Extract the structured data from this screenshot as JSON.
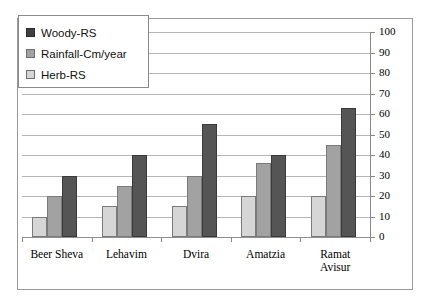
{
  "chart_data": {
    "type": "bar",
    "title": "",
    "subtitle": "",
    "xlabel": "",
    "ylabel": "",
    "ylim": [
      0,
      100
    ],
    "ytick_step": 10,
    "yticks": [
      100,
      90,
      80,
      70,
      60,
      50,
      40,
      30,
      20,
      10,
      0
    ],
    "grid": true,
    "value_axis_position": "right",
    "legend_position": "top-left",
    "categories": [
      "Beer Sheva",
      "Lehavim",
      "Dvira",
      "Amatzia",
      "Ramat\nAvisur"
    ],
    "series": [
      {
        "name": "Herb-RS",
        "color": "#d6d6d6",
        "values": [
          10,
          15,
          15,
          20,
          20
        ]
      },
      {
        "name": "Rainfall-Cm/year",
        "color": "#a2a2a2",
        "values": [
          20,
          25,
          30,
          36,
          45
        ]
      },
      {
        "name": "Woody-RS",
        "color": "#555555",
        "values": [
          30,
          40,
          55,
          40,
          63
        ]
      }
    ],
    "legend_order": [
      "Woody-RS",
      "Rainfall-Cm/year",
      "Herb-RS"
    ]
  },
  "legend": {
    "items": [
      {
        "label": "Woody-RS",
        "swatch": "woody"
      },
      {
        "label": "Rainfall-Cm/year",
        "swatch": "rain"
      },
      {
        "label": "Herb-RS",
        "swatch": "herb"
      }
    ]
  },
  "colors": {
    "woody": "#555555",
    "rainfall": "#a2a2a2",
    "herb": "#d6d6d6",
    "gridline": "#b5b5b5",
    "axis": "#8a8a8a",
    "frame": "#9a9a9a",
    "background": "#ffffff"
  }
}
